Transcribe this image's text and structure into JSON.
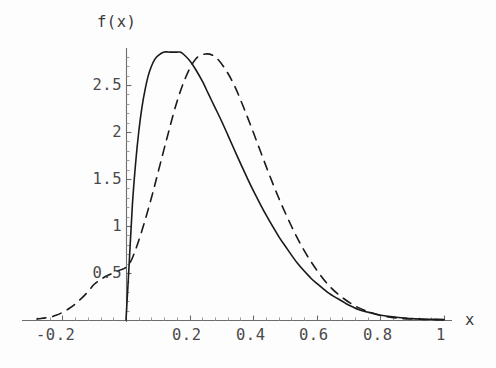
{
  "figure": {
    "background_color": "#fdfdfd",
    "ink_color": "#1a1a1a",
    "axis_color": "#6d6d6d",
    "label_color": "#4a4a4a",
    "ylabel_text": "f(x)",
    "xlabel_text": "x"
  },
  "chart_data": {
    "type": "line",
    "title": "",
    "subtitle": "",
    "xlabel": "x",
    "ylabel": "f(x)",
    "xlim": [
      -0.28,
      1.05
    ],
    "ylim": [
      0,
      3.0
    ],
    "xticks": [
      -0.2,
      0.2,
      0.4,
      0.6,
      0.8,
      1
    ],
    "xtick_labels": [
      "-0.2",
      "0.2",
      "0.4",
      "0.6",
      "0.8",
      "1"
    ],
    "yticks": [
      0.5,
      1,
      1.5,
      2,
      2.5
    ],
    "ytick_labels": [
      "0.5",
      "1",
      "1.5",
      "2",
      "2.5"
    ],
    "minor_ticks": true,
    "grid": false,
    "legend": "none",
    "axes_style": "mathematica-crossed-axes",
    "annotations": [
      "curves intersect near x = 0.19, f = 2.60",
      "solid curve is zero for x <= 0 (rises vertically from origin)",
      "dashed curve has a tail extending to negative x"
    ],
    "series": [
      {
        "name": "solid",
        "style": "solid",
        "color": "#1a1a1a",
        "linewidth": 1.6,
        "peak": {
          "x": 0.17,
          "y": 2.85
        },
        "x": [
          0.0,
          0.01,
          0.02,
          0.03,
          0.04,
          0.05,
          0.06,
          0.07,
          0.08,
          0.09,
          0.1,
          0.12,
          0.14,
          0.16,
          0.17,
          0.18,
          0.2,
          0.22,
          0.24,
          0.26,
          0.28,
          0.3,
          0.32,
          0.35,
          0.38,
          0.4,
          0.44,
          0.48,
          0.5,
          0.54,
          0.58,
          0.6,
          0.64,
          0.68,
          0.7,
          0.74,
          0.78,
          0.8,
          0.85,
          0.9,
          0.95,
          1.0
        ],
        "y": [
          0.0,
          0.6,
          1.22,
          1.66,
          2.0,
          2.26,
          2.45,
          2.6,
          2.7,
          2.77,
          2.81,
          2.85,
          2.85,
          2.85,
          2.85,
          2.83,
          2.76,
          2.66,
          2.54,
          2.4,
          2.26,
          2.12,
          1.97,
          1.74,
          1.52,
          1.38,
          1.12,
          0.89,
          0.79,
          0.6,
          0.45,
          0.39,
          0.28,
          0.2,
          0.16,
          0.1,
          0.07,
          0.05,
          0.03,
          0.015,
          0.008,
          0.004
        ]
      },
      {
        "name": "dashed",
        "style": "dashed",
        "color": "#1a1a1a",
        "linewidth": 1.6,
        "dash_pattern": "9 7",
        "peak": {
          "x": 0.25,
          "y": 2.83
        },
        "x": [
          -0.28,
          -0.26,
          -0.24,
          -0.22,
          -0.2,
          -0.18,
          -0.16,
          -0.14,
          -0.12,
          -0.1,
          -0.08,
          -0.06,
          -0.04,
          -0.02,
          0.0,
          0.02,
          0.05,
          0.08,
          0.1,
          0.13,
          0.16,
          0.19,
          0.22,
          0.25,
          0.28,
          0.31,
          0.34,
          0.37,
          0.4,
          0.44,
          0.48,
          0.52,
          0.56,
          0.6,
          0.64,
          0.68,
          0.72,
          0.76,
          0.8,
          0.85,
          0.9,
          0.95,
          1.0
        ],
        "y": [
          0.01,
          0.02,
          0.03,
          0.05,
          0.08,
          0.12,
          0.17,
          0.23,
          0.3,
          0.38,
          0.43,
          0.47,
          0.5,
          0.53,
          0.56,
          0.66,
          0.95,
          1.3,
          1.56,
          1.95,
          2.32,
          2.6,
          2.78,
          2.83,
          2.8,
          2.68,
          2.5,
          2.26,
          2.0,
          1.64,
          1.3,
          1.0,
          0.74,
          0.53,
          0.36,
          0.24,
          0.15,
          0.09,
          0.05,
          0.02,
          0.01,
          0.005,
          0.002
        ]
      }
    ]
  },
  "geometry": {
    "origin_px": {
      "x": 126,
      "y": 320
    },
    "px_per_x_unit": 318,
    "px_per_y_unit": 94,
    "x_axis_extent_px": {
      "x1": 22,
      "x2": 452
    },
    "y_axis_extent_px": {
      "y1": 48,
      "y2": 322
    }
  },
  "tick_label_positions": {
    "x": [
      {
        "label": "-0.2",
        "left": 36,
        "top": 326
      },
      {
        "label": "0.2",
        "left": 172,
        "top": 326
      },
      {
        "label": "0.4",
        "left": 236,
        "top": 326
      },
      {
        "label": "0.6",
        "left": 299,
        "top": 326
      },
      {
        "label": "0.8",
        "left": 363,
        "top": 326
      },
      {
        "label": "1",
        "left": 436,
        "top": 326
      }
    ],
    "y": [
      {
        "label": "2.5",
        "right": 122,
        "top": 76
      },
      {
        "label": "2",
        "right": 122,
        "top": 123
      },
      {
        "label": "1.5",
        "right": 122,
        "top": 170
      },
      {
        "label": "1",
        "right": 122,
        "top": 217
      },
      {
        "label": "0.5",
        "right": 122,
        "top": 264
      }
    ]
  }
}
